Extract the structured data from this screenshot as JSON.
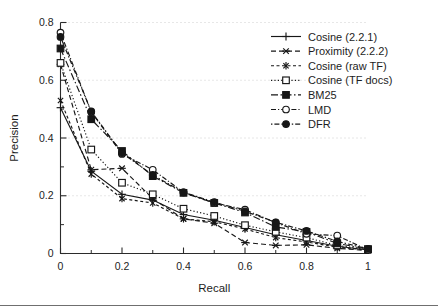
{
  "chart_data": {
    "type": "line",
    "title": "",
    "xlabel": "Recall",
    "ylabel": "Precision",
    "xlim": [
      0,
      1
    ],
    "ylim": [
      0,
      0.8
    ],
    "grid": true,
    "legend_position": "top-right",
    "x": [
      0,
      0.1,
      0.2,
      0.3,
      0.4,
      0.5,
      0.6,
      0.7,
      0.8,
      0.9,
      1
    ],
    "xticks": [
      "0",
      "0.2",
      "0.4",
      "0.6",
      "0.8",
      "1"
    ],
    "xtick_values": [
      0,
      0.2,
      0.4,
      0.6,
      0.8,
      1
    ],
    "yticks": [
      "0",
      "0.2",
      "0.4",
      "0.6",
      "0.8"
    ],
    "ytick_values": [
      0,
      0.2,
      0.4,
      0.6,
      0.8
    ],
    "series": [
      {
        "name": "Cosine (2.2.1)",
        "marker": "plus",
        "dash": "none",
        "values": [
          0.505,
          0.285,
          0.205,
          0.185,
          0.135,
          0.115,
          0.09,
          0.065,
          0.045,
          0.025,
          0.012
        ]
      },
      {
        "name": "Proximity (2.2.2)",
        "marker": "x-star",
        "dash": "dashed",
        "values": [
          0.655,
          0.29,
          0.295,
          0.19,
          0.12,
          0.105,
          0.038,
          0.028,
          0.03,
          0.018,
          0.01
        ]
      },
      {
        "name": "Cosine (raw TF)",
        "marker": "asterisk",
        "dash": "fine-dashed",
        "values": [
          0.53,
          0.275,
          0.19,
          0.175,
          0.12,
          0.11,
          0.085,
          0.055,
          0.04,
          0.022,
          0.012
        ]
      },
      {
        "name": "Cosine (TF docs)",
        "marker": "open-square",
        "dash": "dotted",
        "values": [
          0.66,
          0.36,
          0.245,
          0.205,
          0.155,
          0.13,
          0.098,
          0.075,
          0.055,
          0.028,
          0.014
        ]
      },
      {
        "name": "BM25",
        "marker": "filled-square",
        "dash": "dash-dot",
        "values": [
          0.71,
          0.465,
          0.355,
          0.268,
          0.21,
          0.175,
          0.142,
          0.092,
          0.075,
          0.035,
          0.015
        ]
      },
      {
        "name": "LMD",
        "marker": "open-circle",
        "dash": "dash-dot-fine",
        "values": [
          0.765,
          0.49,
          0.345,
          0.29,
          0.212,
          0.175,
          0.152,
          0.107,
          0.068,
          0.062,
          0.012
        ]
      },
      {
        "name": "DFR",
        "marker": "filled-circle",
        "dash": "dot-dash",
        "values": [
          0.75,
          0.492,
          0.348,
          0.272,
          0.212,
          0.178,
          0.146,
          0.108,
          0.078,
          0.042,
          0.016
        ]
      }
    ]
  }
}
